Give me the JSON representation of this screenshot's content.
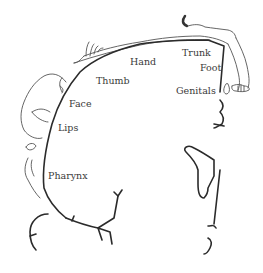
{
  "diagram": {
    "type": "sensory-homunculus",
    "colors": {
      "cortex_line": "#2b2b2b",
      "homunculus_outline": "#555555",
      "label_text": "#3a3a3a",
      "background": "#ffffff"
    },
    "labels": [
      {
        "id": "trunk",
        "text": "Trunk"
      },
      {
        "id": "hand",
        "text": "Hand"
      },
      {
        "id": "foot",
        "text": "Foot"
      },
      {
        "id": "thumb",
        "text": "Thumb"
      },
      {
        "id": "genitals",
        "text": "Genitals"
      },
      {
        "id": "face",
        "text": "Face"
      },
      {
        "id": "lips",
        "text": "Lips"
      },
      {
        "id": "pharynx",
        "text": "Pharynx"
      }
    ]
  }
}
